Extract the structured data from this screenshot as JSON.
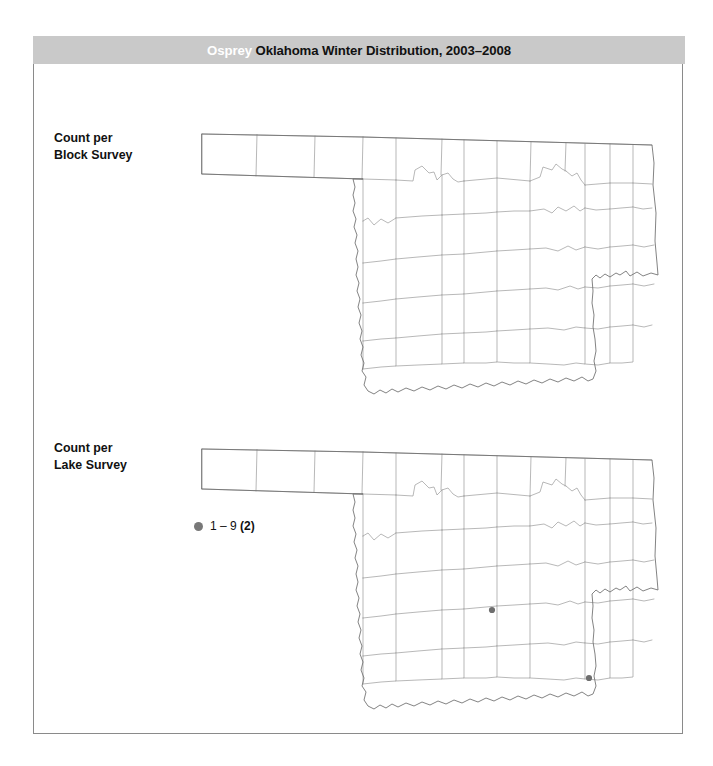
{
  "figure": {
    "title_species": "Osprey",
    "title_rest": "Oklahoma Winter Distribution, 2003–2008"
  },
  "panels": [
    {
      "id": "block",
      "label": "Count per\nBlock Survey",
      "has_legend": false,
      "points": []
    },
    {
      "id": "lake",
      "label": "Count per\nLake Survey",
      "has_legend": true,
      "legend": {
        "symbol": "filled-circle",
        "color": "#787878",
        "range": "1 – 9 ",
        "count": "(2)"
      },
      "points": [
        {
          "x": 296,
          "y": 172
        },
        {
          "x": 393,
          "y": 240
        }
      ]
    }
  ],
  "chart_data": {
    "type": "map",
    "title": "Osprey Oklahoma Winter Distribution, 2003–2008",
    "region": "Oklahoma",
    "subdivision": "counties",
    "panels": [
      {
        "name": "Count per Block Survey",
        "legend_entries": [],
        "occurrences": 0,
        "points": []
      },
      {
        "name": "Count per Lake Survey",
        "legend_entries": [
          {
            "label": "1 – 9",
            "count": 2,
            "color": "#787878"
          }
        ],
        "occurrences": 2,
        "points": [
          {
            "x": 296,
            "y": 172
          },
          {
            "x": 393,
            "y": 240
          }
        ]
      }
    ],
    "colors": {
      "title_bar": "#c9c9c9",
      "county_line": "#9a9a9a",
      "state_outline": "#6d6d6d",
      "point": "#6e6e6e"
    }
  }
}
